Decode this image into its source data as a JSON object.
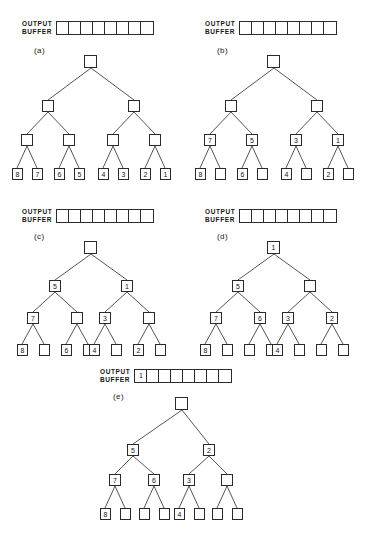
{
  "figure": {
    "buffer_label": "OUTPUT\nBUFFER",
    "buffer_cell_count": 8,
    "line_color": "#2a2a2a",
    "text_color": "#161616",
    "background": "#ffffff"
  },
  "panels": [
    {
      "caption": "(a)",
      "buffer": [
        "",
        "",
        "",
        "",
        "",
        "",
        "",
        ""
      ],
      "root": "",
      "level1": [
        "",
        ""
      ],
      "level2": [
        "",
        "",
        "",
        ""
      ],
      "leaves": [
        "8",
        "7",
        "6",
        "5",
        "4",
        "3",
        "2",
        "1"
      ]
    },
    {
      "caption": "(b)",
      "buffer": [
        "",
        "",
        "",
        "",
        "",
        "",
        "",
        ""
      ],
      "root": "",
      "level1": [
        "",
        ""
      ],
      "level2": [
        "7",
        "5",
        "3",
        "1"
      ],
      "leaves": [
        "8",
        "",
        "6",
        "",
        "4",
        "",
        "2",
        ""
      ]
    },
    {
      "caption": "(c)",
      "buffer": [
        "",
        "",
        "",
        "",
        "",
        "",
        "",
        ""
      ],
      "root": "",
      "level1": [
        "5",
        "1"
      ],
      "level2": [
        "7",
        "",
        "3",
        ""
      ],
      "leaves": [
        "8",
        "",
        "6",
        "",
        "4",
        "",
        "2",
        ""
      ]
    },
    {
      "caption": "(d)",
      "buffer": [
        "",
        "",
        "",
        "",
        "",
        "",
        "",
        ""
      ],
      "root": "1",
      "level1": [
        "5",
        ""
      ],
      "level2": [
        "7",
        "6",
        "3",
        "2"
      ],
      "leaves": [
        "8",
        "",
        "",
        "",
        "4",
        "",
        "",
        ""
      ]
    },
    {
      "caption": "(e)",
      "buffer": [
        "1",
        "",
        "",
        "",
        "",
        "",
        "",
        ""
      ],
      "root": "",
      "level1": [
        "5",
        "2"
      ],
      "level2": [
        "7",
        "6",
        "3",
        ""
      ],
      "leaves": [
        "8",
        "",
        "",
        "",
        "4",
        "",
        "",
        ""
      ]
    }
  ]
}
